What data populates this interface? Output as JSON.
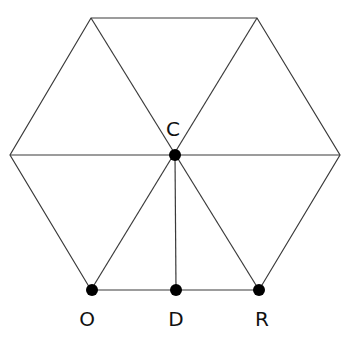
{
  "diagram": {
    "type": "regular hexagon divided into six equilateral triangles",
    "vertices": {
      "top_left": [
        91,
        18
      ],
      "top_right": [
        257,
        18
      ],
      "left": [
        10,
        155
      ],
      "right": [
        340,
        155
      ],
      "bottom_left": [
        91,
        290
      ],
      "bottom_right": [
        259,
        290
      ]
    },
    "points": [
      {
        "label": "C",
        "x": 175,
        "y": 155,
        "label_x": 173,
        "label_y": 136
      },
      {
        "label": "O",
        "x": 92,
        "y": 290,
        "label_x": 87,
        "label_y": 326
      },
      {
        "label": "D",
        "x": 176,
        "y": 290,
        "label_x": 176,
        "label_y": 326
      },
      {
        "label": "R",
        "x": 259,
        "y": 290,
        "label_x": 262,
        "label_y": 326
      }
    ],
    "segments": [
      "hexagon outline",
      "three main diagonals through C",
      "CD perpendicular to OR"
    ]
  }
}
